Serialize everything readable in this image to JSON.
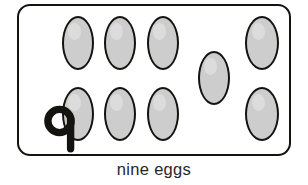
{
  "worksheet": {
    "caption": "nine eggs",
    "numeral": "9",
    "numeral_icon": "handwritten-nine-glyph",
    "count": 9,
    "item_name": "egg",
    "colors": {
      "outline": "#14130f",
      "egg_fill": "#cdcdcd",
      "caption_text": "#26262a",
      "background": "#ffffff"
    },
    "box": {
      "shape": "rounded-rectangle",
      "x": 17,
      "y": 4,
      "width": 274,
      "height": 152,
      "corner_radius": 13,
      "border_width": 2.6
    },
    "eggs": [
      {
        "label": "egg-1",
        "row": "top",
        "x": 63,
        "y": 17,
        "w": 32,
        "h": 54
      },
      {
        "label": "egg-2",
        "row": "top",
        "x": 105,
        "y": 17,
        "w": 32,
        "h": 54
      },
      {
        "label": "egg-3",
        "row": "top",
        "x": 148,
        "y": 17,
        "w": 32,
        "h": 54
      },
      {
        "label": "egg-4",
        "row": "top",
        "x": 246,
        "y": 17,
        "w": 34,
        "h": 54
      },
      {
        "label": "egg-5",
        "row": "middle",
        "x": 199,
        "y": 52,
        "w": 32,
        "h": 54
      },
      {
        "label": "egg-6",
        "row": "bottom",
        "x": 63,
        "y": 88,
        "w": 32,
        "h": 54
      },
      {
        "label": "egg-7",
        "row": "bottom",
        "x": 105,
        "y": 88,
        "w": 32,
        "h": 54
      },
      {
        "label": "egg-8",
        "row": "bottom",
        "x": 148,
        "y": 88,
        "w": 32,
        "h": 54
      },
      {
        "label": "egg-9",
        "row": "bottom",
        "x": 246,
        "y": 88,
        "w": 34,
        "h": 54
      }
    ]
  }
}
